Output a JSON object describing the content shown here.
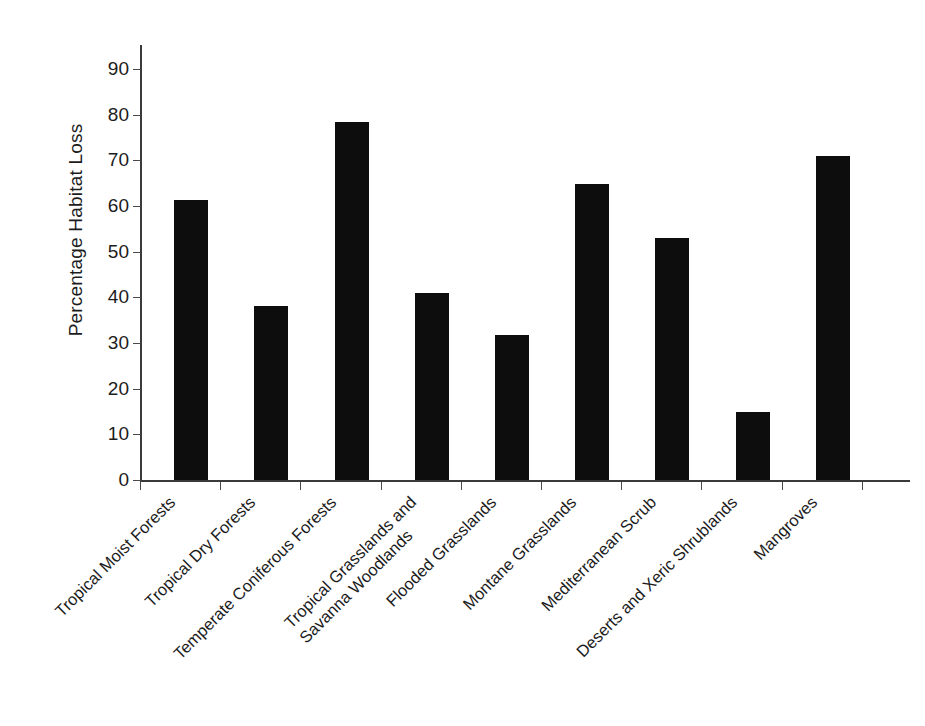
{
  "chart_data": {
    "type": "bar",
    "title": "",
    "xlabel": "",
    "ylabel": "Percentage Habitat Loss",
    "ylim": [
      0,
      95
    ],
    "yticks": [
      0,
      10,
      20,
      30,
      40,
      50,
      60,
      70,
      80,
      90
    ],
    "ytick_labels": [
      "0",
      "10",
      "20",
      "30",
      "40",
      "50",
      "60",
      "70",
      "80",
      "90"
    ],
    "grid": false,
    "legend": null,
    "bar_color": "#0d0d0d",
    "axis_color": "#3a3a3a",
    "categories": [
      "Tropical Moist Forests",
      "Tropical Dry Forests",
      "Temperate Coniferous Forests",
      "Tropical Grasslands and Savanna Woodlands",
      "Flooded Grasslands",
      "Montane Grasslands",
      "Mediterranean Scrub",
      "Deserts and Xeric Shrublands",
      "Mangroves"
    ],
    "category_lines": [
      [
        "Tropical Moist Forests"
      ],
      [
        "Tropical Dry Forests"
      ],
      [
        "Temperate Coniferous Forests"
      ],
      [
        "Tropical Grasslands and",
        "Savanna Woodlands"
      ],
      [
        "Flooded Grasslands"
      ],
      [
        "Montane Grasslands"
      ],
      [
        "Mediterranean Scrub"
      ],
      [
        "Deserts and Xeric Shrublands"
      ],
      [
        "Mangroves"
      ]
    ],
    "values": [
      61.4,
      38.0,
      78.3,
      41.0,
      31.7,
      64.7,
      53.0,
      14.9,
      71.0
    ]
  }
}
